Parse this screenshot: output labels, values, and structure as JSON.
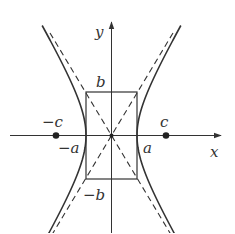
{
  "diagram": {
    "type": "hyperbola",
    "axes": {
      "x_label": "x",
      "y_label": "y"
    },
    "labels": {
      "b_top": "b",
      "b_bottom": "−b",
      "a_pos": "a",
      "a_neg": "−a",
      "c_pos": "c",
      "c_neg": "−c"
    },
    "colors": {
      "stroke": "#333333",
      "background": "#ffffff"
    },
    "elements": [
      "hyperbola-branches",
      "asymptotes (dashed)",
      "central rectangle",
      "foci (filled dots)",
      "origin"
    ]
  }
}
